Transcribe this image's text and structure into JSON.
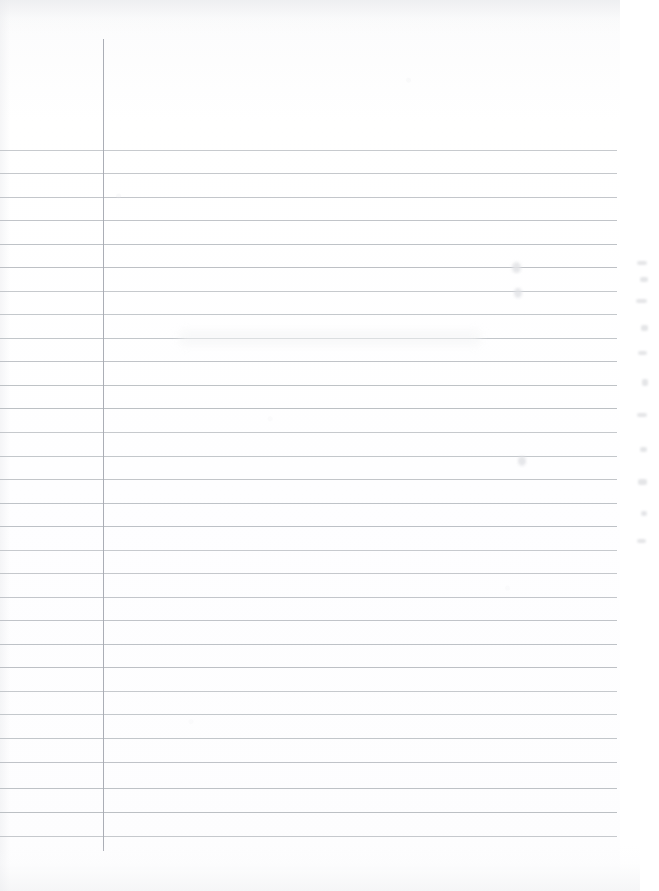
{
  "document": {
    "kind": "scanned-ruled-notebook-page",
    "title": "Blank Ruled Notebook Page",
    "page_width": 659,
    "page_height": 891,
    "background_color": "#ffffff",
    "content_text": "",
    "has_handwriting": false
  },
  "paper": {
    "sheet_left": 0,
    "sheet_top": 0,
    "sheet_width": 620,
    "sheet_height": 870,
    "tint_color": "#fdfdfe"
  },
  "ruling": {
    "style": "wide-ruled",
    "rule_color": "#b9bdc2",
    "rule_thickness_px": 1,
    "rule_left_x": 0,
    "rule_right_x": 617,
    "first_rule_y": 150,
    "rule_spacing_px": 23.6,
    "rule_count": 30,
    "rule_y_positions": [
      150,
      173,
      197,
      220,
      244,
      267,
      291,
      314,
      338,
      361,
      385,
      408,
      432,
      456,
      479,
      503,
      526,
      550,
      573,
      597,
      620,
      644,
      667,
      691,
      714,
      738,
      762,
      788,
      812,
      836
    ]
  },
  "margin_rule": {
    "label": "vertical-margin-line",
    "color": "#a6aab2",
    "thickness_px": 1,
    "x": 103,
    "top_y": 39,
    "bottom_y": 851
  },
  "marks": [
    {
      "name": "pencil-smudge-upper",
      "x": 512,
      "y": 262,
      "w": 9,
      "h": 11,
      "color": "#e2e3e6",
      "opacity": 0.85
    },
    {
      "name": "pencil-smudge-mid",
      "x": 514,
      "y": 288,
      "w": 8,
      "h": 10,
      "color": "#e0e1e5",
      "opacity": 0.8
    },
    {
      "name": "pencil-smudge-lower",
      "x": 518,
      "y": 456,
      "w": 8,
      "h": 10,
      "color": "#dfe0e4",
      "opacity": 0.8
    },
    {
      "name": "paper-wash-band",
      "x": 180,
      "y": 330,
      "w": 300,
      "h": 16,
      "color": "#f3f4f5",
      "opacity": 0.55
    }
  ],
  "scan_artifacts": {
    "name": "right-edge-bleed",
    "description": "faint vertical column of scan flecks near right edge",
    "color": "#dcdde0",
    "flecks": [
      {
        "x": 4,
        "y": 6,
        "w": 10,
        "h": 4
      },
      {
        "x": 7,
        "y": 22,
        "w": 8,
        "h": 5
      },
      {
        "x": 3,
        "y": 44,
        "w": 11,
        "h": 4
      },
      {
        "x": 8,
        "y": 70,
        "w": 7,
        "h": 6
      },
      {
        "x": 5,
        "y": 96,
        "w": 9,
        "h": 4
      },
      {
        "x": 9,
        "y": 124,
        "w": 6,
        "h": 7
      },
      {
        "x": 4,
        "y": 158,
        "w": 10,
        "h": 4
      },
      {
        "x": 7,
        "y": 192,
        "w": 7,
        "h": 5
      },
      {
        "x": 5,
        "y": 224,
        "w": 9,
        "h": 6
      },
      {
        "x": 8,
        "y": 256,
        "w": 6,
        "h": 5
      },
      {
        "x": 4,
        "y": 284,
        "w": 9,
        "h": 4
      }
    ]
  }
}
